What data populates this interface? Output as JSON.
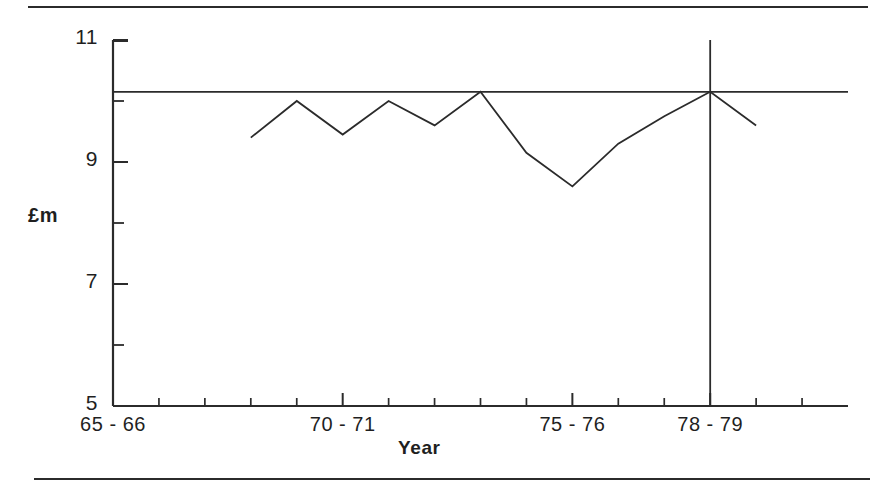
{
  "figure": {
    "name": "line-chart-expenditure-by-year",
    "background": "#ffffff",
    "line_color": "#2b2b2b",
    "axis_color": "#2b2b2b"
  },
  "axis_titles": {
    "y": "£m",
    "x": "Year"
  },
  "y_ticks": [
    {
      "value": 11,
      "label": "11",
      "major": true
    },
    {
      "value": 10,
      "label": "",
      "major": false
    },
    {
      "value": 9,
      "label": "9",
      "major": true
    },
    {
      "value": 8,
      "label": "",
      "major": false
    },
    {
      "value": 7,
      "label": "7",
      "major": true
    },
    {
      "value": 6,
      "label": "",
      "major": false
    },
    {
      "value": 5,
      "label": "5",
      "major": true
    }
  ],
  "x_ticks": [
    {
      "index": 0,
      "label": "65 - 66",
      "major": true
    },
    {
      "index": 1,
      "label": "",
      "major": false
    },
    {
      "index": 2,
      "label": "",
      "major": false
    },
    {
      "index": 3,
      "label": "",
      "major": false
    },
    {
      "index": 4,
      "label": "",
      "major": false
    },
    {
      "index": 5,
      "label": "70 - 71",
      "major": true
    },
    {
      "index": 6,
      "label": "",
      "major": false
    },
    {
      "index": 7,
      "label": "",
      "major": false
    },
    {
      "index": 8,
      "label": "",
      "major": false
    },
    {
      "index": 9,
      "label": "",
      "major": false
    },
    {
      "index": 10,
      "label": "75 - 76",
      "major": true
    },
    {
      "index": 11,
      "label": "",
      "major": false
    },
    {
      "index": 12,
      "label": "",
      "major": false
    },
    {
      "index": 13,
      "label": "78 - 79",
      "major": true
    },
    {
      "index": 14,
      "label": "",
      "major": false
    },
    {
      "index": 15,
      "label": "",
      "major": false
    }
  ],
  "chart_data": {
    "type": "line",
    "title": "",
    "subtitle": "",
    "xlabel": "Year",
    "ylabel": "£m",
    "grid": false,
    "legend": "none",
    "xlim": [
      0,
      16
    ],
    "ylim": [
      5,
      11
    ],
    "x_tick_labels": [
      "65 - 66",
      "70 - 71",
      "75 - 76",
      "78 - 79"
    ],
    "y_tick_labels": [
      "5",
      "7",
      "9",
      "11"
    ],
    "categories": [
      "68 - 69",
      "69 - 70",
      "70 - 71",
      "71 - 72",
      "72 - 73",
      "73 - 74",
      "74 - 75",
      "75 - 76",
      "76 - 77",
      "77 - 78",
      "78 - 79",
      "79 - 80"
    ],
    "series": [
      {
        "name": "Expenditure",
        "values": [
          9.4,
          10.0,
          9.45,
          10.0,
          9.6,
          10.15,
          9.15,
          8.6,
          9.3,
          9.75,
          10.15,
          9.6
        ]
      }
    ],
    "reference_lines": [
      {
        "name": "horizontal-reference",
        "orientation": "horizontal",
        "value": 10.15
      },
      {
        "name": "vertical-reference",
        "orientation": "vertical",
        "category": "78 - 79"
      }
    ],
    "annotations": []
  }
}
